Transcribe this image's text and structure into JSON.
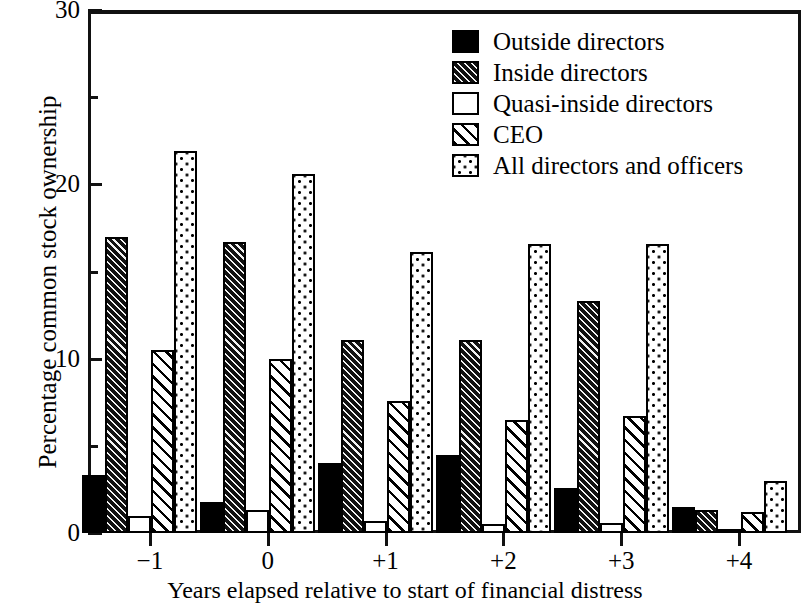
{
  "chart_data": {
    "type": "bar",
    "title": "",
    "xlabel": "Years elapsed relative to start of financial distress",
    "ylabel": "Percentage common stock ownership",
    "categories": [
      "−1",
      "0",
      "+1",
      "+2",
      "+3",
      "+4"
    ],
    "ylim": [
      0,
      30
    ],
    "yticks": [
      0,
      10,
      20,
      30
    ],
    "ytick_labels": [
      "0",
      "10",
      "20",
      "30"
    ],
    "yticks_minor": [
      5,
      15,
      25
    ],
    "grid": false,
    "legend_position": "top-right",
    "series": [
      {
        "name": "Outside directors",
        "pattern": "solid-black",
        "values": [
          3.3,
          1.8,
          4.0,
          4.5,
          2.6,
          1.5
        ]
      },
      {
        "name": "Inside directors",
        "pattern": "dense-dark-diagonal-hatch",
        "values": [
          17.0,
          16.7,
          11.1,
          11.1,
          13.3,
          1.3
        ]
      },
      {
        "name": "Quasi-inside directors",
        "pattern": "white-empty",
        "values": [
          1.0,
          1.3,
          0.7,
          0.5,
          0.6,
          0.2
        ]
      },
      {
        "name": "CEO",
        "pattern": "light-diagonal-hatch",
        "values": [
          10.5,
          10.0,
          7.6,
          6.5,
          6.7,
          1.2
        ]
      },
      {
        "name": "All directors and officers",
        "pattern": "dotted-stipple",
        "values": [
          21.9,
          20.6,
          16.1,
          16.6,
          16.6,
          3.0
        ]
      }
    ]
  },
  "legend": {
    "items": [
      {
        "label": "Outside directors",
        "pattern": "solid"
      },
      {
        "label": "Inside directors",
        "pattern": "densehatch"
      },
      {
        "label": "Quasi-inside directors",
        "pattern": "white"
      },
      {
        "label": "CEO",
        "pattern": "hatch"
      },
      {
        "label": "All directors and officers",
        "pattern": "dots"
      }
    ]
  }
}
